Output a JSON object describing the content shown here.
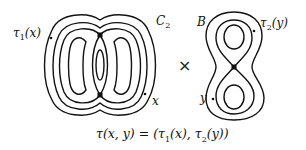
{
  "diagram": {
    "left_space": {
      "name": "C_2",
      "label": "C",
      "label_sub": "2",
      "points": [
        {
          "label_base": "τ",
          "label_sub": "1",
          "label_arg": "(x)",
          "role": "image point"
        },
        {
          "label": "x",
          "role": "point"
        }
      ],
      "critical_points": 2
    },
    "operator": "×",
    "right_space": {
      "name": "B",
      "label": "B",
      "points": [
        {
          "label_base": "τ",
          "label_sub": "2",
          "label_arg": "(y)",
          "role": "image point"
        },
        {
          "label": "y",
          "role": "point"
        }
      ],
      "critical_points": 1
    },
    "formula": {
      "lhs": "τ(x, y) = (",
      "t1": "τ",
      "t1_sub": "1",
      "t1_arg": "(x), ",
      "t2": "τ",
      "t2_sub": "2",
      "t2_arg": "(y))"
    },
    "stroke_color": "#111111"
  }
}
